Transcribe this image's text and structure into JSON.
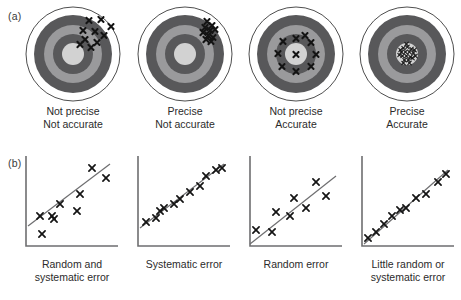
{
  "panels": {
    "a": {
      "label": "(a)"
    },
    "b": {
      "label": "(b)"
    }
  },
  "colors": {
    "ring_outer_white": "#ffffff",
    "ring_dark": "#58585a",
    "ring_mid": "#9a9a9c",
    "ring_inner_dark": "#58585a",
    "bullseye": "#d2d2d2",
    "outline": "#3a3a3a",
    "mark": "#141414",
    "axis": "#6e6e70",
    "trend_line": "#6e6e70",
    "text": "#2b2b2b"
  },
  "targets": [
    {
      "id": "target-not-precise-not-accurate",
      "caption_line1": "Not precise",
      "caption_line2": "Not accurate",
      "marks": [
        {
          "x": 64,
          "y": 14
        },
        {
          "x": 76,
          "y": 13
        },
        {
          "x": 86,
          "y": 20
        },
        {
          "x": 58,
          "y": 24
        },
        {
          "x": 70,
          "y": 25
        },
        {
          "x": 79,
          "y": 29
        },
        {
          "x": 60,
          "y": 33
        },
        {
          "x": 72,
          "y": 36
        },
        {
          "x": 55,
          "y": 38
        },
        {
          "x": 66,
          "y": 41
        }
      ]
    },
    {
      "id": "target-precise-not-accurate",
      "caption_line1": "Precise",
      "caption_line2": "Not accurate",
      "marks": [
        {
          "x": 70,
          "y": 15
        },
        {
          "x": 75,
          "y": 19
        },
        {
          "x": 68,
          "y": 21
        },
        {
          "x": 73,
          "y": 24
        },
        {
          "x": 78,
          "y": 23
        },
        {
          "x": 66,
          "y": 26
        },
        {
          "x": 71,
          "y": 29
        },
        {
          "x": 76,
          "y": 31
        },
        {
          "x": 69,
          "y": 33
        },
        {
          "x": 74,
          "y": 35
        }
      ]
    },
    {
      "id": "target-not-precise-accurate",
      "caption_line1": "Not precise",
      "caption_line2": "Accurate",
      "marks": [
        {
          "x": 48,
          "y": 48
        },
        {
          "x": 48,
          "y": 32
        },
        {
          "x": 63,
          "y": 36
        },
        {
          "x": 68,
          "y": 48
        },
        {
          "x": 63,
          "y": 60
        },
        {
          "x": 48,
          "y": 65
        },
        {
          "x": 34,
          "y": 60
        },
        {
          "x": 30,
          "y": 47
        },
        {
          "x": 35,
          "y": 35
        },
        {
          "x": 57,
          "y": 29
        }
      ]
    },
    {
      "id": "target-precise-accurate",
      "caption_line1": "Precise",
      "caption_line2": "Accurate",
      "marks": [
        {
          "x": 45,
          "y": 42
        },
        {
          "x": 49,
          "y": 41
        },
        {
          "x": 53,
          "y": 43
        },
        {
          "x": 43,
          "y": 46
        },
        {
          "x": 47,
          "y": 46
        },
        {
          "x": 51,
          "y": 46
        },
        {
          "x": 55,
          "y": 47
        },
        {
          "x": 44,
          "y": 50
        },
        {
          "x": 48,
          "y": 50
        },
        {
          "x": 52,
          "y": 51
        },
        {
          "x": 46,
          "y": 54
        },
        {
          "x": 50,
          "y": 54
        },
        {
          "x": 54,
          "y": 52
        },
        {
          "x": 42,
          "y": 44
        },
        {
          "x": 56,
          "y": 44
        },
        {
          "x": 45,
          "y": 57
        },
        {
          "x": 51,
          "y": 57
        },
        {
          "x": 41,
          "y": 49
        },
        {
          "x": 57,
          "y": 50
        },
        {
          "x": 48,
          "y": 38
        }
      ]
    }
  ],
  "plots": [
    {
      "id": "plot-random-and-systematic-error",
      "caption_line1": "Random and",
      "caption_line2": "systematic error",
      "line": {
        "x1": 6,
        "y1": 72,
        "x2": 88,
        "y2": 10
      },
      "points": [
        {
          "x": 20,
          "y": 80
        },
        {
          "x": 18,
          "y": 62
        },
        {
          "x": 32,
          "y": 65
        },
        {
          "x": 38,
          "y": 50
        },
        {
          "x": 55,
          "y": 57
        },
        {
          "x": 58,
          "y": 40
        },
        {
          "x": 70,
          "y": 14
        },
        {
          "x": 84,
          "y": 24
        },
        {
          "x": 30,
          "y": 62
        }
      ]
    },
    {
      "id": "plot-systematic-error",
      "caption_line1": "Systematic error",
      "caption_line2": "",
      "line": {
        "x1": 6,
        "y1": 74,
        "x2": 90,
        "y2": 10
      },
      "points": [
        {
          "x": 12,
          "y": 68
        },
        {
          "x": 22,
          "y": 64
        },
        {
          "x": 26,
          "y": 57
        },
        {
          "x": 30,
          "y": 54
        },
        {
          "x": 40,
          "y": 50
        },
        {
          "x": 46,
          "y": 45
        },
        {
          "x": 56,
          "y": 38
        },
        {
          "x": 66,
          "y": 32
        },
        {
          "x": 72,
          "y": 22
        },
        {
          "x": 82,
          "y": 16
        },
        {
          "x": 88,
          "y": 14
        }
      ]
    },
    {
      "id": "plot-random-error",
      "caption_line1": "Random error",
      "caption_line2": "",
      "line": {
        "x1": 4,
        "y1": 90,
        "x2": 90,
        "y2": 22
      },
      "points": [
        {
          "x": 10,
          "y": 76
        },
        {
          "x": 26,
          "y": 78
        },
        {
          "x": 30,
          "y": 58
        },
        {
          "x": 44,
          "y": 62
        },
        {
          "x": 48,
          "y": 44
        },
        {
          "x": 60,
          "y": 54
        },
        {
          "x": 70,
          "y": 28
        },
        {
          "x": 80,
          "y": 42
        }
      ]
    },
    {
      "id": "plot-little-random-or-systematic-error",
      "caption_line1": "Little random or",
      "caption_line2": "systematic error",
      "line": {
        "x1": 6,
        "y1": 90,
        "x2": 90,
        "y2": 16
      },
      "points": [
        {
          "x": 10,
          "y": 84
        },
        {
          "x": 18,
          "y": 78
        },
        {
          "x": 26,
          "y": 70
        },
        {
          "x": 34,
          "y": 62
        },
        {
          "x": 42,
          "y": 56
        },
        {
          "x": 48,
          "y": 54
        },
        {
          "x": 58,
          "y": 44
        },
        {
          "x": 68,
          "y": 40
        },
        {
          "x": 80,
          "y": 28
        },
        {
          "x": 88,
          "y": 20
        }
      ]
    }
  ]
}
